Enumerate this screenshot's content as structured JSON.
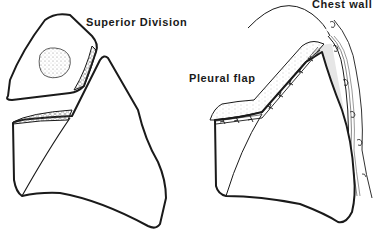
{
  "figure": {
    "left_panel": {
      "label": "Superior Division",
      "parts": [
        "superior-division-segment",
        "tumor-mass",
        "raw-lung-surface",
        "remaining-lobe"
      ]
    },
    "right_panel": {
      "labels": {
        "chest_wall": "Chest wall",
        "pleural_flap": "Pleural flap"
      },
      "parts": [
        "chest-wall-ribs",
        "pleural-flap",
        "suture-line",
        "remaining-lobe"
      ]
    },
    "colors": {
      "ink": "#1a1a1a",
      "background": "#ffffff",
      "stipple": "#8a8a8a",
      "shade": "#e6e6e6"
    }
  }
}
